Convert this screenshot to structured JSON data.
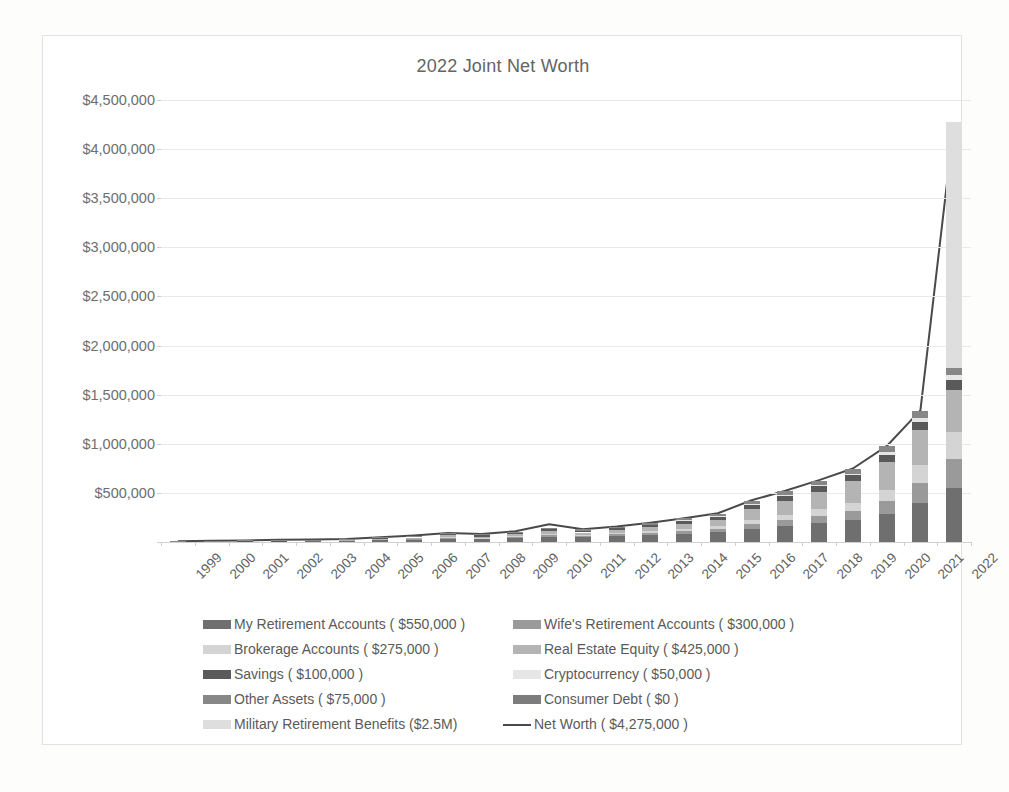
{
  "chart_data": {
    "type": "bar",
    "subtype": "stacked-bar-with-line",
    "title": "2022 Joint Net Worth",
    "xlabel": "",
    "ylabel": "",
    "ylim": [
      0,
      4500000
    ],
    "ytick_values": [
      0,
      500000,
      1000000,
      1500000,
      2000000,
      2500000,
      3000000,
      3500000,
      4000000,
      4500000
    ],
    "ytick_labels": [
      "",
      "$500,000",
      "$1,000,000",
      "$1,500,000",
      "$2,000,000",
      "$2,500,000",
      "$3,000,000",
      "$3,500,000",
      "$4,000,000",
      "$4,500,000"
    ],
    "grid": true,
    "legend_position": "bottom",
    "categories": [
      "1999",
      "2000",
      "2001",
      "2002",
      "2003",
      "2004",
      "2005",
      "2006",
      "2007",
      "2008",
      "2009",
      "2010",
      "2011",
      "2012",
      "2013",
      "2014",
      "2015",
      "2016",
      "2017",
      "2018",
      "2019",
      "2020",
      "2021",
      "2022"
    ],
    "series": [
      {
        "name": "My Retirement Accounts",
        "legend_label": "My Retirement Accounts ( $550,000 )",
        "final_value": 550000,
        "color": "#6f6f6f",
        "values": [
          2000,
          4000,
          6000,
          8000,
          11000,
          14000,
          20000,
          26000,
          34000,
          30000,
          42000,
          56000,
          50000,
          60000,
          72000,
          86000,
          100000,
          135000,
          160000,
          190000,
          225000,
          290000,
          400000,
          550000
        ]
      },
      {
        "name": "Wife's Retirement Accounts",
        "legend_label": "Wife's Retirement Accounts ( $300,000 )",
        "final_value": 300000,
        "color": "#9a9a9a",
        "values": [
          0,
          0,
          0,
          0,
          1000,
          2000,
          4000,
          6000,
          9000,
          8000,
          12000,
          17000,
          15000,
          19000,
          24000,
          30000,
          36000,
          52000,
          64000,
          78000,
          95000,
          125000,
          200000,
          300000
        ]
      },
      {
        "name": "Brokerage Accounts",
        "legend_label": "Brokerage Accounts ( $275,000 )",
        "final_value": 275000,
        "color": "#d4d4d4",
        "values": [
          0,
          0,
          0,
          0,
          0,
          0,
          1000,
          2000,
          4000,
          3000,
          6000,
          9000,
          8000,
          11000,
          15000,
          20000,
          26000,
          40000,
          52000,
          66000,
          82000,
          110000,
          180000,
          275000
        ]
      },
      {
        "name": "Real Estate Equity",
        "legend_label": "Real Estate Equity ( $425,000 )",
        "final_value": 425000,
        "color": "#b4b4b4",
        "values": [
          0,
          0,
          0,
          0,
          0,
          2000,
          6000,
          12000,
          20000,
          14000,
          20000,
          30000,
          24000,
          30000,
          40000,
          52000,
          66000,
          110000,
          145000,
          180000,
          215000,
          290000,
          360000,
          425000
        ]
      },
      {
        "name": "Savings",
        "legend_label": "Savings ( $100,000 )",
        "final_value": 100000,
        "color": "#5a5a5a",
        "values": [
          3000,
          4000,
          5000,
          6000,
          7000,
          8000,
          10000,
          12000,
          14000,
          16000,
          18000,
          22000,
          20000,
          22000,
          26000,
          30000,
          34000,
          44000,
          50000,
          56000,
          62000,
          74000,
          86000,
          100000
        ]
      },
      {
        "name": "Cryptocurrency",
        "legend_label": "Cryptocurrency ( $50,000 )",
        "final_value": 50000,
        "color": "#e6e6e6",
        "values": [
          0,
          0,
          0,
          0,
          0,
          0,
          0,
          0,
          0,
          0,
          0,
          0,
          0,
          0,
          1000,
          2000,
          3000,
          6000,
          9000,
          12000,
          16000,
          26000,
          40000,
          50000
        ]
      },
      {
        "name": "Other Assets",
        "legend_label": "Other Assets ( $75,000 )",
        "final_value": 75000,
        "color": "#878787",
        "values": [
          1000,
          1500,
          2000,
          2500,
          3000,
          4000,
          5000,
          6000,
          8000,
          7000,
          9000,
          12000,
          11000,
          13000,
          16000,
          20000,
          24000,
          32000,
          38000,
          44000,
          50000,
          58000,
          66000,
          75000
        ]
      },
      {
        "name": "Consumer Debt",
        "legend_label": "Consumer Debt ( $0 )",
        "final_value": 0,
        "color": "#7c7c7c",
        "values": [
          0,
          0,
          0,
          0,
          0,
          0,
          0,
          0,
          0,
          0,
          0,
          0,
          0,
          0,
          0,
          0,
          0,
          0,
          0,
          0,
          0,
          0,
          0,
          0
        ]
      },
      {
        "name": "Military Retirement Benefits",
        "legend_label": "Military Retirement Benefits ($2.5M)",
        "final_value": 2500000,
        "color": "#dedede",
        "values": [
          0,
          0,
          0,
          0,
          0,
          0,
          0,
          0,
          0,
          0,
          0,
          0,
          0,
          0,
          0,
          0,
          0,
          0,
          0,
          0,
          0,
          0,
          0,
          2500000
        ]
      }
    ],
    "line_series": {
      "name": "Net Worth",
      "legend_label": "Net Worth ( $4,275,000 )",
      "final_value": 4275000,
      "color": "#4a4a4a",
      "values": [
        8000,
        12000,
        16000,
        22000,
        26000,
        32000,
        48000,
        66000,
        92000,
        80000,
        110000,
        180000,
        130000,
        158000,
        196000,
        242000,
        292000,
        425000,
        522000,
        630000,
        748000,
        975000,
        1340000,
        4275000
      ]
    }
  },
  "legend": {
    "column_left": [
      "My Retirement Accounts ( $550,000 )",
      "Brokerage Accounts ( $275,000 )",
      "Savings ( $100,000 )",
      "Other Assets ( $75,000 )"
    ],
    "column_right": [
      "Wife's Retirement Accounts ( $300,000 )",
      "Real Estate Equity ( $425,000 )",
      "Cryptocurrency ( $50,000 )",
      "Consumer Debt ( $0 )"
    ],
    "bottom": [
      "Military Retirement Benefits ($2.5M)",
      "Net Worth ( $4,275,000 )"
    ]
  }
}
